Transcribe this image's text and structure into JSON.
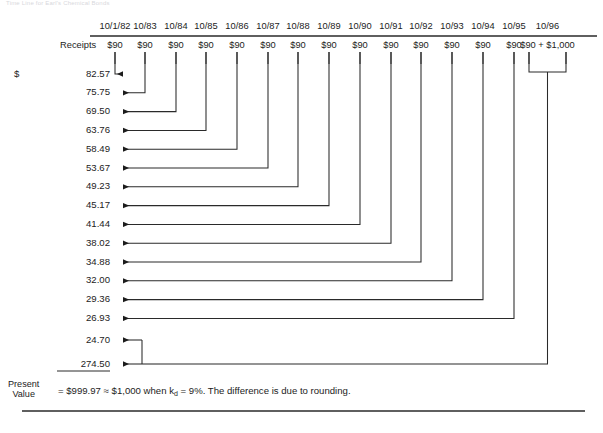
{
  "top_caption": "Time Line for Earl's Chemical Bonds",
  "header": {
    "receipts_label": "Receipts",
    "dates": [
      "10/1/82",
      "10/83",
      "10/84",
      "10/85",
      "10/86",
      "10/87",
      "10/88",
      "10/89",
      "10/90",
      "10/91",
      "10/92",
      "10/93",
      "10/94",
      "10/95",
      "10/96"
    ],
    "cash_flows": [
      "$90",
      "$90",
      "$90",
      "$90",
      "$90",
      "$90",
      "$90",
      "$90",
      "$90",
      "$90",
      "$90",
      "$90",
      "$90",
      "$90",
      "$90 + $1,000"
    ]
  },
  "present_values": {
    "currency_prefix": "$",
    "rows": [
      {
        "value": "82.57",
        "source_date": "10/1/82"
      },
      {
        "value": "75.75",
        "source_date": "10/83"
      },
      {
        "value": "69.50",
        "source_date": "10/84"
      },
      {
        "value": "63.76",
        "source_date": "10/85"
      },
      {
        "value": "58.49",
        "source_date": "10/86"
      },
      {
        "value": "53.67",
        "source_date": "10/87"
      },
      {
        "value": "49.23",
        "source_date": "10/88"
      },
      {
        "value": "45.17",
        "source_date": "10/89"
      },
      {
        "value": "41.44",
        "source_date": "10/90"
      },
      {
        "value": "38.02",
        "source_date": "10/91"
      },
      {
        "value": "34.88",
        "source_date": "10/92"
      },
      {
        "value": "32.00",
        "source_date": "10/93"
      },
      {
        "value": "29.36",
        "source_date": "10/94"
      },
      {
        "value": "26.93",
        "source_date": "10/95"
      },
      {
        "value": "24.70",
        "source_date": "10/96"
      },
      {
        "value": "274.50",
        "source_date": "10/96"
      }
    ]
  },
  "footer": {
    "pv_label_line1": "Present",
    "pv_label_line2": "Value",
    "formula_prefix": "= $999.97 ≈ $1,000 when k",
    "formula_sub": "d",
    "formula_suffix": " = 9%. The difference is due to rounding.",
    "total": "$999.97",
    "approx_total": "$1,000",
    "discount_rate": "9%"
  },
  "chart_data": {
    "type": "table",
    "categories": [
      "10/1/82",
      "10/83",
      "10/84",
      "10/85",
      "10/86",
      "10/87",
      "10/88",
      "10/89",
      "10/90",
      "10/91",
      "10/92",
      "10/93",
      "10/94",
      "10/95",
      "10/96",
      "10/96"
    ],
    "series": [
      {
        "name": "Receipts",
        "values": [
          90,
          90,
          90,
          90,
          90,
          90,
          90,
          90,
          90,
          90,
          90,
          90,
          90,
          90,
          90,
          1000
        ]
      },
      {
        "name": "Present Value",
        "values": [
          82.57,
          75.75,
          69.5,
          63.76,
          58.49,
          53.67,
          49.23,
          45.17,
          41.44,
          38.02,
          34.88,
          32.0,
          29.36,
          26.93,
          24.7,
          274.5
        ]
      }
    ],
    "sum_present_value": 999.97,
    "discount_rate_pct": 9,
    "face_value": 1000,
    "grid": false,
    "legend": "none"
  },
  "geometry": {
    "col_x": [
      115,
      145,
      176,
      206,
      237,
      268,
      298,
      329,
      360,
      391,
      421,
      452,
      483,
      514,
      529,
      566
    ],
    "row_y": [
      74,
      92.8,
      111.6,
      130.4,
      149.2,
      168,
      186.8,
      205.6,
      224.4,
      243.2,
      262,
      280.8,
      299.6,
      318.4,
      340,
      364
    ],
    "arrow_x": 122,
    "header_rule": {
      "x1": 90,
      "x2": 597,
      "y": 36
    },
    "bottom_rule": {
      "x1": 22,
      "x2": 585,
      "y": 411
    },
    "total_rule": {
      "x1": 57,
      "x2": 110,
      "y": 371
    }
  }
}
